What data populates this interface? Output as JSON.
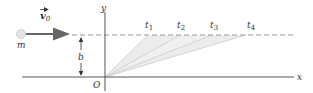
{
  "diagram": {
    "type": "physics-trajectory",
    "labels": {
      "mass": "m",
      "velocity": "v",
      "velocity_subscript": "0",
      "distance": "b",
      "origin": "O",
      "x_axis": "x",
      "y_axis": "y",
      "times": [
        "t",
        "t",
        "t",
        "t"
      ],
      "time_subscripts": [
        "1",
        "2",
        "3",
        "4"
      ]
    },
    "colors": {
      "axis": "#555555",
      "dashed": "#999999",
      "arrow": "#666666",
      "particle": "#dddddd",
      "wedge_fill": "#e8e8e8",
      "wedge_line": "#cccccc"
    }
  }
}
